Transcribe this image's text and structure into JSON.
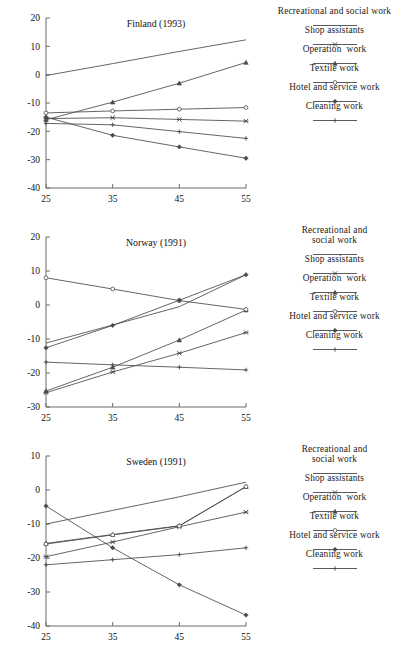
{
  "figure": {
    "background": "#ffffff",
    "line_color": "#4a4a4a",
    "axis_color": "#6b6b6b",
    "text_color": "#111111"
  },
  "series_styles": [
    {
      "key": "recreational",
      "marker": "none"
    },
    {
      "key": "shop",
      "marker": "cross-x"
    },
    {
      "key": "operation",
      "marker": "triangle"
    },
    {
      "key": "textile",
      "marker": "circle"
    },
    {
      "key": "hotel",
      "marker": "diamond"
    },
    {
      "key": "cleaning",
      "marker": "plus"
    }
  ],
  "legend_common": {
    "entries": [
      {
        "label": "Recreational and social work",
        "marker": "none"
      },
      {
        "label": "Shop assistants",
        "marker": "cross-x"
      },
      {
        "label": "Operation  work",
        "marker": "triangle"
      },
      {
        "label": "Textile work",
        "marker": "circle"
      },
      {
        "label": "Hotel and service work",
        "marker": "diamond"
      },
      {
        "label": "Cleaning work",
        "marker": "plus"
      }
    ]
  },
  "legend_wrapped": {
    "entries": [
      {
        "label": "Recreational and\nsocial work",
        "marker": "none"
      },
      {
        "label": "Shop assistants",
        "marker": "cross-x"
      },
      {
        "label": "Operation  work",
        "marker": "triangle"
      },
      {
        "label": "Textile work",
        "marker": "circle"
      },
      {
        "label": "Hotel and service work",
        "marker": "diamond"
      },
      {
        "label": "Cleaning work",
        "marker": "plus"
      }
    ]
  },
  "chart_data": [
    {
      "type": "line",
      "title": "Finland (1993)",
      "xlabel": "",
      "ylabel": "",
      "x": [
        25,
        35,
        45,
        55
      ],
      "xticks": [
        25,
        35,
        45,
        55
      ],
      "xlim": [
        25,
        55
      ],
      "yticks": [
        20,
        10,
        0,
        -10,
        -20,
        -30,
        -40
      ],
      "ylim": [
        -40,
        20
      ],
      "grid": false,
      "legend_position": "right",
      "series": [
        {
          "name": "Recreational and social work",
          "marker": "none",
          "values": [
            -0.3,
            3.9,
            8.2,
            12.3
          ]
        },
        {
          "name": "Shop assistants",
          "marker": "cross-x",
          "values": [
            -15.5,
            -15.2,
            -15.8,
            -16.4
          ]
        },
        {
          "name": "Operation  work",
          "marker": "triangle",
          "values": [
            -15.9,
            -9.7,
            -3.0,
            4.3
          ]
        },
        {
          "name": "Textile work",
          "marker": "circle",
          "values": [
            -13.5,
            -12.8,
            -12.2,
            -11.6
          ]
        },
        {
          "name": "Hotel and service work",
          "marker": "diamond",
          "values": [
            -15.0,
            -21.4,
            -25.5,
            -29.5
          ]
        },
        {
          "name": "Cleaning work",
          "marker": "plus",
          "values": [
            -17.2,
            -17.7,
            -20.1,
            -22.5
          ]
        }
      ]
    },
    {
      "type": "line",
      "title": "Norway (1991)",
      "xlabel": "",
      "ylabel": "",
      "x": [
        25,
        35,
        45,
        55
      ],
      "xticks": [
        25,
        35,
        45,
        55
      ],
      "xlim": [
        25,
        55
      ],
      "yticks": [
        20,
        10,
        0,
        -10,
        -20,
        -30
      ],
      "ylim": [
        -30,
        20
      ],
      "grid": false,
      "legend_position": "right",
      "series": [
        {
          "name": "Recreational and social work",
          "marker": "none",
          "values": [
            -11.2,
            -5.9,
            -0.5,
            8.9
          ]
        },
        {
          "name": "Shop assistants",
          "marker": "cross-x",
          "values": [
            -25.8,
            -19.7,
            -14.2,
            -8.1
          ]
        },
        {
          "name": "Operation  work",
          "marker": "triangle",
          "values": [
            -25.3,
            -18.3,
            -10.3,
            -1.5
          ]
        },
        {
          "name": "Textile work",
          "marker": "circle",
          "values": [
            8.0,
            4.7,
            1.3,
            -1.3
          ]
        },
        {
          "name": "Hotel and service work",
          "marker": "diamond",
          "values": [
            -12.6,
            -6.0,
            1.4,
            8.9
          ]
        },
        {
          "name": "Cleaning work",
          "marker": "plus",
          "values": [
            -16.8,
            -17.6,
            -18.3,
            -19.1
          ]
        }
      ]
    },
    {
      "type": "line",
      "title": "Sweden (1991)",
      "xlabel": "",
      "ylabel": "",
      "x": [
        25,
        35,
        45,
        55
      ],
      "xticks": [
        25,
        35,
        45,
        55
      ],
      "xlim": [
        25,
        55
      ],
      "yticks": [
        10,
        0,
        -10,
        -20,
        -30,
        -40
      ],
      "ylim": [
        -40,
        10
      ],
      "grid": false,
      "legend_position": "right",
      "series": [
        {
          "name": "Recreational and social work",
          "marker": "none",
          "values": [
            -10.0,
            -6.0,
            -2.0,
            2.3
          ]
        },
        {
          "name": "Shop assistants",
          "marker": "cross-x",
          "values": [
            -19.6,
            -15.3,
            -10.8,
            -6.5
          ]
        },
        {
          "name": "Operation  work",
          "marker": "triangle",
          "values": [
            -15.7,
            -13.1,
            -10.5,
            1.0
          ]
        },
        {
          "name": "Textile work",
          "marker": "circle",
          "values": [
            -15.9,
            -13.2,
            -10.6,
            1.0
          ]
        },
        {
          "name": "Hotel and service work",
          "marker": "diamond",
          "values": [
            -4.7,
            -17.0,
            -27.9,
            -36.8
          ]
        },
        {
          "name": "Cleaning work",
          "marker": "plus",
          "values": [
            -22.0,
            -20.5,
            -19.0,
            -17.0
          ]
        }
      ]
    }
  ]
}
